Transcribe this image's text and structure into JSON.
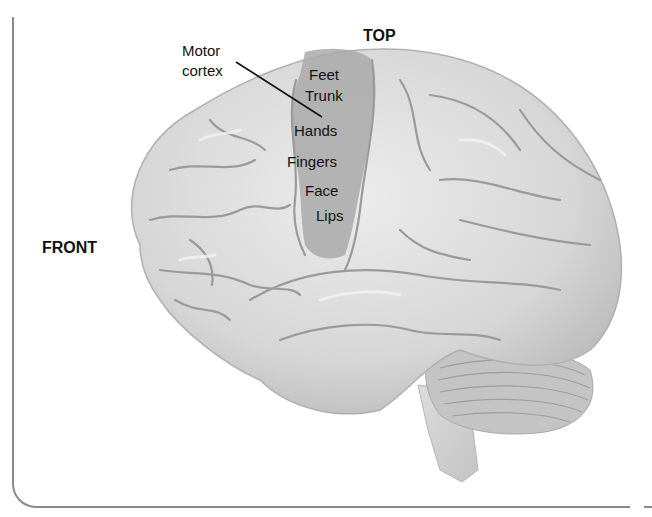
{
  "diagram": {
    "orientation_labels": {
      "top": "TOP",
      "front": "FRONT"
    },
    "callout": {
      "line1": "Motor",
      "line2": "cortex"
    },
    "motor_cortex_regions": [
      "Feet",
      "Trunk",
      "Hands",
      "Fingers",
      "Face",
      "Lips"
    ],
    "colors": {
      "brain_fill": "#d9d9d9",
      "brain_highlight": "#ececec",
      "sulcus": "#9a9a9a",
      "motor_cortex_band": "#a8a8a8",
      "cerebellum": "#bdbdbd",
      "label_text": "#111111",
      "frame_border": "#8a8a8a"
    }
  }
}
